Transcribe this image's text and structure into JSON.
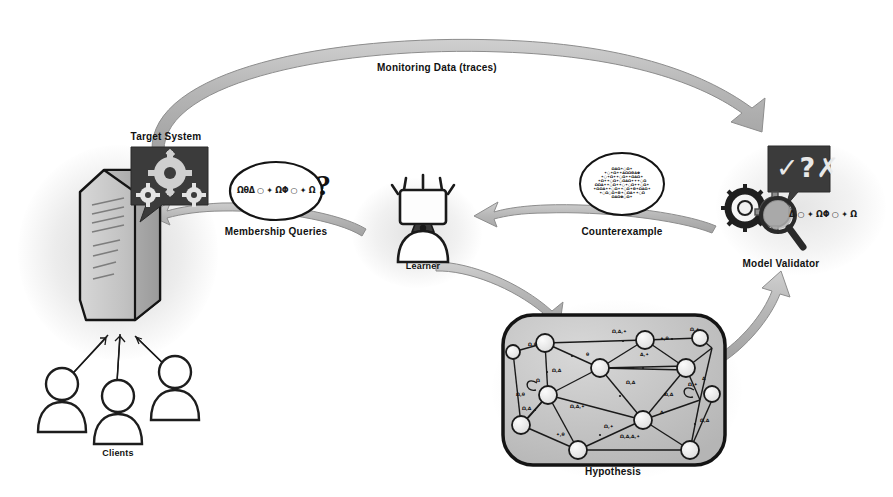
{
  "diagram": {
    "nodes": {
      "target_system": {
        "label": "Target System",
        "icon": "gears-bubble-icon"
      },
      "clients": {
        "label": "Clients",
        "icon": "person-icon",
        "count": 3
      },
      "learner": {
        "label": "Learner",
        "icon": "person-with-monitor-head-icon"
      },
      "model_validator": {
        "label": "Model Validator",
        "icon": "magnifier-gears-icon",
        "bubble_glyphs": "✓?✗"
      },
      "hypothesis": {
        "label": "Hypothesis",
        "icon": "state-machine-graph-icon"
      }
    },
    "edges": {
      "monitoring": {
        "label": "Monitoring Data (traces)",
        "from": "target_system",
        "to": "model_validator"
      },
      "membership": {
        "label": "Membership Queries",
        "from": "learner",
        "to": "target_system"
      },
      "counterexample": {
        "label": "Counterexample",
        "from": "model_validator",
        "to": "learner"
      },
      "conjecture": {
        "label": "",
        "from": "learner",
        "to": "hypothesis"
      },
      "validate": {
        "label": "",
        "from": "hypothesis",
        "to": "model_validator"
      }
    },
    "bubbles": {
      "membership_query": {
        "symbols": "ΩθΔ ○ ✦ ΩΦ ○ ✦ Ω",
        "question_mark": "?"
      },
      "validator_symbols": "Δ ○ ✦ ΩΦ ○ ✦ Ω",
      "counterexample_lines": [
        "ΩΔΩ✦○Ω✦",
        "✦○✦Ω✦✦ΔΩΩΘΔΦ",
        "✦○✦Ω✦✦○Ω✦✦ΩΔΩ✦",
        "✦Ω✦✦○Ω✦○ΩΔΩ✦✦✦○Ω",
        "ΩΩΔ✦✦○Ω✦✦○✦○Ω✦✦○Ω✦",
        "✦ΩΩΔ✦✦○Ω✦✦○Ω✦Θ✦ΩΔΩ✦",
        "✦○Ω○Ω✦Θ✦○ΩΔ✦✦○Ω",
        "ΩΔΩΦ○Ω✦"
      ]
    },
    "graph": {
      "node_count": 12,
      "edge_labels": [
        "Ω,Δ,✦",
        "Ω,✦",
        "Ω,θ",
        "Ω,Δ",
        "θ",
        "Δ,✦",
        "✦,θ",
        "Ω,Δ",
        "Ω",
        "Ω,θ",
        "Ω,Δ",
        "Δ",
        "Ω,Δ,✦",
        "Ω,✦",
        "Ω,Δ",
        "Ω,Δ,Δ,✦",
        "Δ",
        "Ω,✦",
        "Ω,Δ",
        "✦,θ"
      ]
    },
    "colors": {
      "arrow_band": "#b4b4b4",
      "arrow_band_edge": "#8f8f8f",
      "ink": "#141414",
      "node_fill": "#efefef",
      "panel_fill": "#c9c9c9",
      "dark_bubble": "#3a3a3a"
    }
  }
}
